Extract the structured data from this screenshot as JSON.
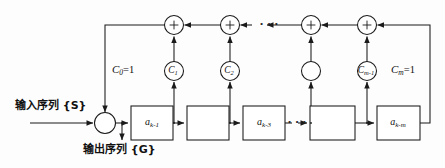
{
  "diagram": {
    "stroke_color": "#1a1a1a",
    "background_color": "#fdfdfd",
    "signals": {
      "input_label": "输入序列 {S}",
      "output_label": "输出序列 {G}"
    },
    "adders": [
      {
        "name": "input-adder",
        "symbol": "+"
      },
      {
        "name": "top-adder-1",
        "symbol": "+"
      },
      {
        "name": "top-adder-2",
        "symbol": "+"
      },
      {
        "name": "top-adder-3",
        "symbol": "+"
      },
      {
        "name": "top-adder-4",
        "symbol": "+"
      }
    ],
    "tap_circles": [
      {
        "name": "tap-c1",
        "main": "C",
        "sub": "1"
      },
      {
        "name": "tap-c2",
        "main": "C",
        "sub": "2"
      },
      {
        "name": "tap-cx",
        "main": "",
        "sub": ""
      },
      {
        "name": "tap-cm1",
        "main": "C",
        "sub": "m-1"
      }
    ],
    "tap_text_labels": [
      {
        "name": "tap-c0-label",
        "main": "C",
        "sub": "0",
        "eq": "=1"
      },
      {
        "name": "tap-cm-label",
        "main": "C",
        "sub": "m",
        "eq": "=1"
      }
    ],
    "delay_boxes": [
      {
        "name": "delay-box-1",
        "main": "a",
        "sub": "k-1"
      },
      {
        "name": "delay-box-2",
        "main": "",
        "sub": ""
      },
      {
        "name": "delay-box-3",
        "main": "a",
        "sub": "k-3"
      },
      {
        "name": "delay-box-4",
        "main": "",
        "sub": ""
      },
      {
        "name": "delay-box-5",
        "main": "a",
        "sub": "k-m"
      }
    ],
    "ellipses": [
      {
        "name": "top-ellipsis",
        "glyph": "• • •"
      },
      {
        "name": "bottom-ellipsis",
        "glyph": "• • •"
      }
    ]
  }
}
